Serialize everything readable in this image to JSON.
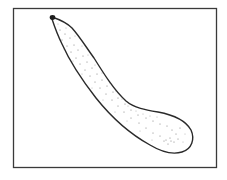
{
  "figure": {
    "subject": "zucchini",
    "colors": {
      "background": "#ffffff",
      "frame": "#3a3a3a",
      "outline": "#2a2a2a",
      "stipple": "#6a6a6a",
      "stem": "#1e1e1e"
    }
  }
}
